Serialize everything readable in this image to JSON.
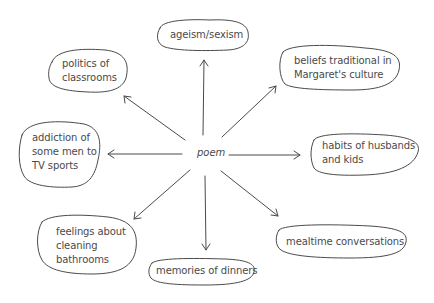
{
  "diagram": {
    "center": {
      "label": "poem",
      "x": 197,
      "y": 147
    },
    "style": {
      "stroke": "#4a4a4a",
      "text": "#4a4a4a",
      "background": "#ffffff"
    },
    "nodes": [
      {
        "id": "ageism",
        "label": "ageism/sexism",
        "x": 170,
        "y": 28
      },
      {
        "id": "politics",
        "label": "politics of\nclassrooms",
        "x": 62,
        "y": 58
      },
      {
        "id": "beliefs",
        "label": "beliefs traditional in\nMargaret's culture",
        "x": 294,
        "y": 53
      },
      {
        "id": "addiction",
        "label": "addiction of\nsome men to\nTV sports",
        "x": 32,
        "y": 127
      },
      {
        "id": "habits",
        "label": "habits of husbands\nand kids",
        "x": 322,
        "y": 139
      },
      {
        "id": "feelings",
        "label": "feelings about\ncleaning\nbathrooms",
        "x": 56,
        "y": 224
      },
      {
        "id": "memories",
        "label": "memories of dinners",
        "x": 156,
        "y": 263
      },
      {
        "id": "mealtime",
        "label": "mealtime conversations",
        "x": 286,
        "y": 230
      }
    ]
  }
}
